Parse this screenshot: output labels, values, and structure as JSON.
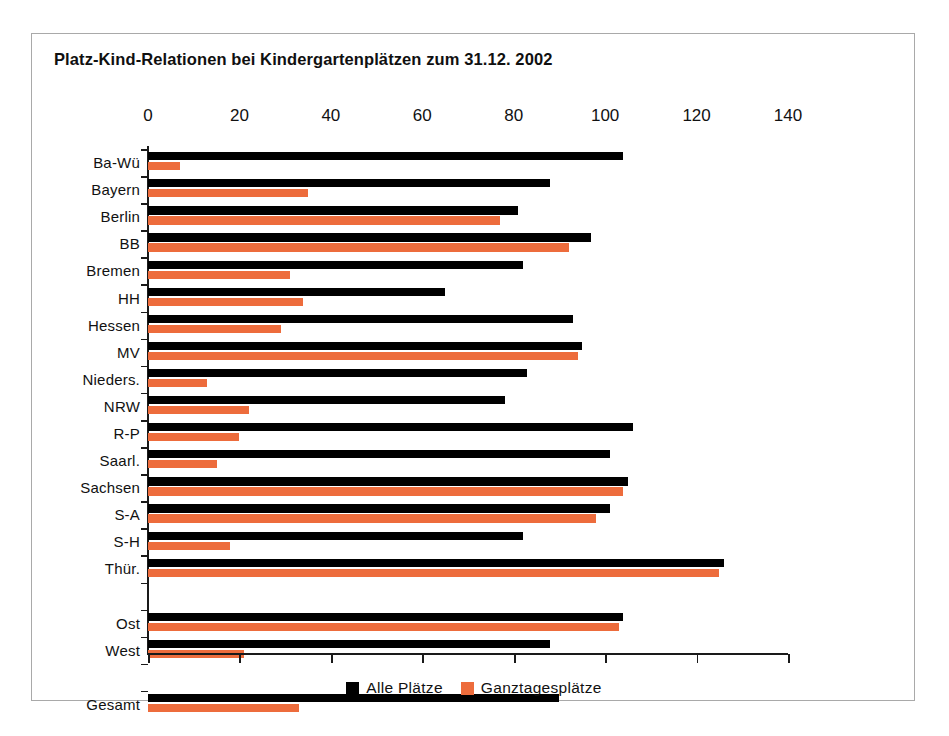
{
  "chart_data": {
    "type": "bar",
    "orientation": "horizontal",
    "title": "Platz-Kind-Relationen bei Kindergartenplätzen zum 31.12. 2002",
    "xlabel": "",
    "ylabel": "",
    "xlim": [
      0,
      140
    ],
    "xticks": [
      "0",
      "20",
      "40",
      "60",
      "80",
      "100",
      "120",
      "140"
    ],
    "grid": false,
    "legend_position": "bottom",
    "categories": [
      "Ba-Wü",
      "Bayern",
      "Berlin",
      "BB",
      "Bremen",
      "HH",
      "Hessen",
      "MV",
      "Nieders.",
      "NRW",
      "R-P",
      "Saarl.",
      "Sachsen",
      "S-A",
      "S-H",
      "Thür.",
      "",
      "Ost",
      "West",
      "",
      "Gesamt"
    ],
    "series": [
      {
        "name": "Alle Plätze",
        "color": "#000000",
        "values": [
          104,
          88,
          81,
          97,
          82,
          65,
          93,
          95,
          83,
          78,
          106,
          101,
          105,
          101,
          82,
          126,
          null,
          104,
          88,
          null,
          90
        ]
      },
      {
        "name": "Ganztagesplätze",
        "color": "#ed6c3c",
        "values": [
          7,
          35,
          77,
          92,
          31,
          34,
          29,
          94,
          13,
          22,
          20,
          15,
          104,
          98,
          18,
          125,
          null,
          103,
          21,
          null,
          33
        ]
      }
    ]
  }
}
